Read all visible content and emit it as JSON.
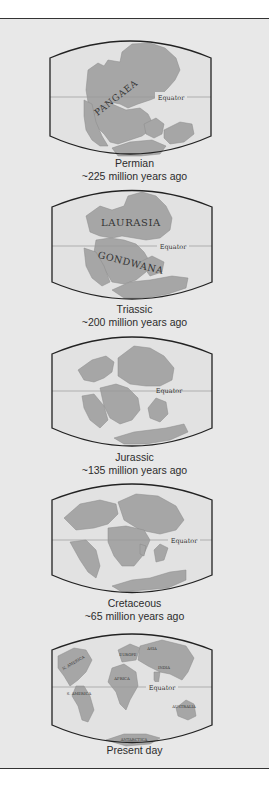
{
  "figure": {
    "colors": {
      "background": "#e8e8e8",
      "land": "#a6a6a6",
      "frame": "#222222",
      "equator": "#9a9a9a",
      "text": "#2c2c2c"
    },
    "equator_label": "Equator",
    "maps": [
      {
        "period": "Permian",
        "age": "~225 million years ago",
        "labels": [
          "PANGAEA"
        ]
      },
      {
        "period": "Triassic",
        "age": "~200 million years ago",
        "labels": [
          "LAURASIA",
          "GONDWANA"
        ]
      },
      {
        "period": "Jurassic",
        "age": "~135 million years ago",
        "labels": []
      },
      {
        "period": "Cretaceous",
        "age": "~65 million years ago",
        "labels": []
      },
      {
        "period": "Present day",
        "age": "",
        "labels": [
          "N. AMERICA",
          "EUROPE",
          "ASIA",
          "AFRICA",
          "INDIA",
          "S. AMERICA",
          "AUSTRALIA",
          "ANTARCTICA"
        ]
      }
    ]
  }
}
